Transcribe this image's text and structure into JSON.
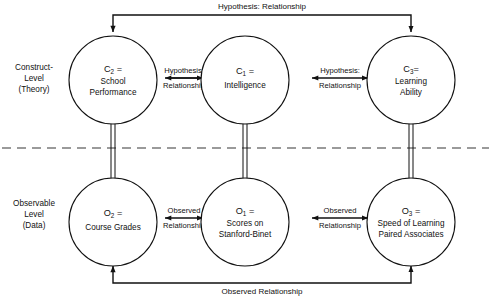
{
  "diagram": {
    "background_color": "#ffffff",
    "line_color": "#111111",
    "divider_color": "#7a7a7a",
    "levels": [
      {
        "id": "construct-level",
        "line1": "Construct-",
        "line2": "Level",
        "line3": "(Theory)"
      },
      {
        "id": "observable-level",
        "line1": "Observable",
        "line2": "Level",
        "line3": "(Data)"
      }
    ],
    "nodes": [
      {
        "id": "c2",
        "symbol": "C",
        "subscript": "2",
        "equals": " =",
        "line1": "School",
        "line2": "Performance",
        "line3": ""
      },
      {
        "id": "c1",
        "symbol": "C",
        "subscript": "1",
        "equals": " =",
        "line1": "Intelligence",
        "line2": "",
        "line3": ""
      },
      {
        "id": "c3",
        "symbol": "C",
        "subscript": "3",
        "equals": "=",
        "line1": "Learning",
        "line2": "Ability",
        "line3": ""
      },
      {
        "id": "o2",
        "symbol": "O",
        "subscript": "2",
        "equals": " =",
        "line1": "Course Grades",
        "line2": "",
        "line3": ""
      },
      {
        "id": "o1",
        "symbol": "O",
        "subscript": "1",
        "equals": " =",
        "line1": "Scores on",
        "line2": "Stanford-Binet",
        "line3": ""
      },
      {
        "id": "o3",
        "symbol": "O",
        "subscript": "3",
        "equals": " =",
        "line1": "Speed of Learning",
        "line2": "Paired Associates",
        "line3": ""
      }
    ],
    "edges": [
      {
        "id": "c2-c1",
        "line1": "Hypothesis:",
        "line2": "Relationship"
      },
      {
        "id": "c1-c3",
        "line1": "Hypothesis:",
        "line2": "Relationship"
      },
      {
        "id": "o2-o1",
        "line1": "Observed",
        "line2": "Relationship"
      },
      {
        "id": "o1-o3",
        "line1": "Observed",
        "line2": "Relationship"
      }
    ],
    "outer_edges": [
      {
        "id": "c2-c3-outer",
        "label": "Hypothesis: Relationship"
      },
      {
        "id": "o2-o3-outer",
        "label": "Observed Relationship"
      }
    ]
  }
}
